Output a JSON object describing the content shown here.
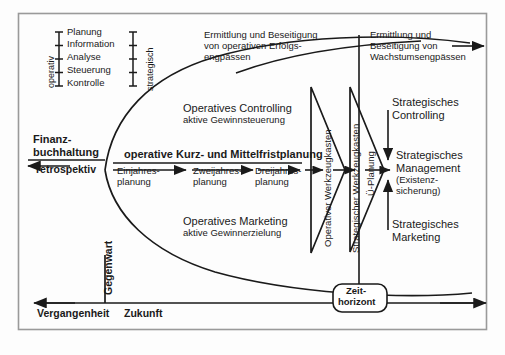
{
  "diagram": {
    "title_visible": false,
    "frame": {
      "x": 18,
      "y": 13,
      "w": 469,
      "h": 317,
      "border_color": "#9a9a9a"
    },
    "scale_left": {
      "axis_label_left": "operativ",
      "axis_label_right": "strategisch",
      "items": [
        "Planung",
        "Information",
        "Analyse",
        "Steuerung",
        "Kontrolle"
      ]
    },
    "callouts": {
      "top_left": "Ermittlung und Beseitigung\nvon operativen Erfolgs-\nengpässen",
      "top_left_l1": "Ermittlung und Beseitigung",
      "top_left_l2": "von operativen Erfolgs-",
      "top_left_l3": "engpässen",
      "top_right_l1": "Ermittlung und",
      "top_right_l2": "Beseitigung von",
      "top_right_l3": "Wachstumsengpässen"
    },
    "upper_block": {
      "line1": "Operatives Controlling",
      "line2": "aktive Gewinnsteuerung"
    },
    "lower_block": {
      "line1": "Operatives Marketing",
      "line2": "aktive Gewinnerzielung"
    },
    "left_axis_block": {
      "line1": "Finanz-",
      "line2": "buchhaltung",
      "line3": "retrospektiv"
    },
    "planning_row": {
      "heading": "operative Kurz- und Mittelfristplanung",
      "steps": [
        {
          "line1": "Einjahres-",
          "line2": "planung"
        },
        {
          "line1": "Zweijahres-",
          "line2": "planung"
        },
        {
          "line1": "Dreijahres-",
          "line2": "planung"
        }
      ]
    },
    "vertical_labels": {
      "operative_toolbox": "Operativer Werkzeugkasten",
      "strategic_toolbox": "Strategischer Werkzeugkasten",
      "transition_planning": "Ü-Planung",
      "present": "Gegenwart"
    },
    "right_block": {
      "controlling_l1": "Strategisches",
      "controlling_l2": "Controlling",
      "management_l1": "Strategisches",
      "management_l2": "Management",
      "management_l3": "(Existenz-",
      "management_l4": "sicherung)",
      "marketing_l1": "Strategisches",
      "marketing_l2": "Marketing"
    },
    "time_axis": {
      "past": "Vergangenheit",
      "future": "Zukunft",
      "horizon_l1": "Zeit-",
      "horizon_l2": "horizont"
    },
    "colors": {
      "stroke": "#1a1a1a",
      "text": "#1a1a1a",
      "frame": "#9a9a9a",
      "background": "#fdfdfd"
    }
  }
}
